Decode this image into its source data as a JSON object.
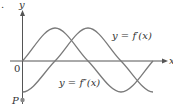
{
  "figure": {
    "marker": ".",
    "axes": {
      "x_label": "x",
      "y_label": "y",
      "origin_label": "0"
    },
    "point": {
      "label": "P"
    },
    "curves": [
      {
        "name": "first-derivative",
        "label": "y = f′(x)"
      },
      {
        "name": "second-derivative",
        "label": "y = f″(x)"
      }
    ],
    "colors": {
      "axis": "#555555",
      "curve": "#7a7a7a",
      "text": "#333333",
      "point": "#888888"
    }
  }
}
